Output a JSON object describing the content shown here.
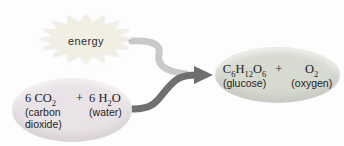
{
  "diagram": {
    "energy": {
      "label": "energy"
    },
    "reactants": {
      "co2": {
        "formula": [
          {
            "text": "6 CO"
          },
          {
            "sub": "2"
          }
        ],
        "label": "(carbon dioxide)"
      },
      "plus": "+",
      "h2o": {
        "formula": [
          {
            "text": "6 H"
          },
          {
            "sub": "2"
          },
          {
            "text": "O"
          }
        ],
        "label": "(water)"
      }
    },
    "products": {
      "glucose": {
        "formula": [
          {
            "text": "C"
          },
          {
            "sub": "6"
          },
          {
            "text": "H"
          },
          {
            "sub": "12"
          },
          {
            "text": "O"
          },
          {
            "sub": "6"
          }
        ],
        "label": "(glucose)"
      },
      "plus": "+",
      "oxygen": {
        "formula": [
          {
            "text": "O"
          },
          {
            "sub": "2"
          }
        ],
        "label": "(oxygen)"
      }
    },
    "colors": {
      "energy_burst_fill": "#f1efe4",
      "reactants_oval_fill": "#e9e2e6",
      "products_oval_fill": "#d7dad1",
      "arrow_light": "#c9c9c9",
      "arrow_dark": "#6f6f6f"
    }
  }
}
